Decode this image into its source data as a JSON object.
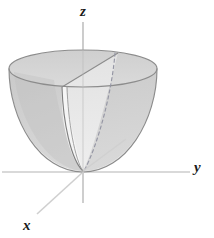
{
  "figure": {
    "type": "3d-surface-sketch",
    "surface_name": "paraboloid",
    "background_color": "#ffffff",
    "canvas": {
      "width": 214,
      "height": 238
    }
  },
  "axes": {
    "z": {
      "label": "z",
      "orientation": "vertical",
      "label_position": {
        "x": 80,
        "y": 4
      },
      "line": {
        "x1": 83,
        "y1": 22,
        "x2": 83,
        "y2": 203
      },
      "color": "#c9c9c9"
    },
    "y": {
      "label": "y",
      "orientation": "horizontal-right",
      "label_position": {
        "x": 194,
        "y": 160
      },
      "line": {
        "x1": 2,
        "y1": 172,
        "x2": 190,
        "y2": 172
      },
      "color": "#c9c9c9"
    },
    "x": {
      "label": "x",
      "orientation": "diagonal-lower-left",
      "label_position": {
        "x": 23,
        "y": 218
      },
      "line": {
        "x1": 83,
        "y1": 172,
        "x2": 37,
        "y2": 214
      },
      "color": "#c9c9c9"
    },
    "origin": {
      "x": 83,
      "y": 172
    }
  },
  "surface": {
    "vertex": {
      "x": 83,
      "y": 172
    },
    "rim_ellipse": {
      "center_x": 83,
      "center_y": 68.5,
      "radius_x": 74,
      "radius_y": 18.5,
      "top_y": 50,
      "bottom_y": 87,
      "left_x": 9,
      "right_x": 157
    },
    "colors": {
      "rim_top_fill": "#d2d2d2",
      "outer_shell_fill": "#fafafa",
      "inner_cut_fill": "#cfcfcf",
      "inner_shadow_fill": "#bfbfbf",
      "cross_section_fill": "#e9e9e9",
      "outline_stroke": "#8a8a8a",
      "hidden_edge_stroke": "#9a9aa8",
      "axis_stroke": "#c9c9c9",
      "label_text": "#1a1a1a"
    },
    "edges": {
      "hidden_dashed_edge": "from rim point (115,53) curving down to vertex (83,172)",
      "cut_plane_edge": "straight chord from (62,87) to (118,53)",
      "interior_ray": "light ray from vertex (83,172) to (126,139)"
    }
  }
}
